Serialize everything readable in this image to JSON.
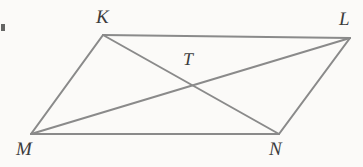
{
  "figure": {
    "name": "parallelogram-with-diagonals",
    "background_color": "#fbfaf8",
    "line_color": "#8a8a8a",
    "label_color": "#3c3c3c",
    "vertices": [
      {
        "id": "K",
        "label": "K",
        "x": 103,
        "y": 35,
        "label_x": 96,
        "label_y": 8
      },
      {
        "id": "L",
        "label": "L",
        "x": 350,
        "y": 38,
        "label_x": 339,
        "label_y": 10
      },
      {
        "id": "N",
        "label": "N",
        "x": 279,
        "y": 134,
        "label_x": 269,
        "label_y": 140
      },
      {
        "id": "M",
        "label": "M",
        "x": 31,
        "y": 134,
        "label_x": 16,
        "label_y": 140
      }
    ],
    "intersection": {
      "id": "T",
      "label": "T",
      "x": 191,
      "y": 87,
      "label_x": 183,
      "label_y": 50
    },
    "edges": [
      {
        "id": "KL",
        "from": "K",
        "to": "L"
      },
      {
        "id": "LN",
        "from": "L",
        "to": "N"
      },
      {
        "id": "NM",
        "from": "N",
        "to": "M"
      },
      {
        "id": "MK",
        "from": "M",
        "to": "K"
      }
    ],
    "diagonals": [
      {
        "id": "KN",
        "from": "K",
        "to": "N"
      },
      {
        "id": "ML",
        "from": "M",
        "to": "L"
      }
    ]
  }
}
